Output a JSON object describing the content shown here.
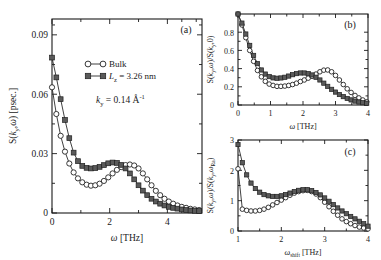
{
  "figure": {
    "background": "#ffffff",
    "line_color": "#2b2b2b",
    "square_fill": "#5a5a5a",
    "circle_fill": "#ffffff"
  },
  "legend": {
    "entries": [
      {
        "label": "Bulk",
        "marker": "open-circle"
      },
      {
        "label": "L_z = 3.26 nm",
        "marker": "filled-square",
        "prefix_italic": "L",
        "sub": "z",
        "rest": " = 3.26 nm"
      }
    ]
  },
  "annotation": {
    "k_symbol": "k",
    "k_sub": "y",
    "k_value": " = 0.14 ",
    "k_unit": "Å",
    "k_unit_sup": "-1"
  },
  "panels": {
    "a": {
      "tag": "(a)",
      "xlabel_symbol": "ω",
      "xlabel_unit": " [THz]",
      "ylabel": "S(k_y,ω)  [psec.]",
      "xticks": [
        "0",
        "2",
        "4"
      ],
      "yticks": [
        "0",
        "0.03",
        "0.06",
        "0.09"
      ]
    },
    "b": {
      "tag": "(b)",
      "xlabel_symbol": "ω",
      "xlabel_unit": " [THz]",
      "ylabel": "S(k_y,ω)/S(k_y,0)",
      "xticks": [
        "0",
        "1",
        "2",
        "3",
        "4"
      ],
      "yticks": [
        "0",
        "0.2",
        "0.4",
        "0.6",
        "0.8"
      ]
    },
    "c": {
      "tag": "(c)",
      "xlabel_symbol": "ω",
      "xlabel_sub": "shift",
      "xlabel_unit": " [THz]",
      "ylabel": "S(k_y,ω)/S(k_y,ω_Ra)",
      "xticks": [
        "1",
        "2",
        "3",
        "4"
      ],
      "yticks": [
        "0",
        "1",
        "2",
        "3"
      ]
    }
  },
  "chart_data": [
    {
      "type": "line",
      "panel": "a",
      "title": "(a)",
      "xlabel": "ω [THz]",
      "ylabel": "S(k_y,ω) [psec.]",
      "xlim": [
        0,
        5.2
      ],
      "ylim": [
        0,
        0.098
      ],
      "xticks": [
        0,
        2,
        4
      ],
      "yticks": [
        0,
        0.03,
        0.06,
        0.09
      ],
      "grid": false,
      "legend": "inside-top-center",
      "annotation": "k_y = 0.14 Å^-1",
      "series": [
        {
          "name": "Bulk",
          "marker": "open-circle",
          "x": [
            0,
            0.15,
            0.3,
            0.45,
            0.6,
            0.75,
            0.9,
            1.05,
            1.2,
            1.35,
            1.5,
            1.65,
            1.8,
            1.95,
            2.1,
            2.25,
            2.4,
            2.55,
            2.7,
            2.85,
            3.0,
            3.15,
            3.3,
            3.45,
            3.6,
            3.75,
            3.9,
            4.05,
            4.2,
            4.35,
            4.5,
            4.65,
            4.8,
            4.95,
            5.1
          ],
          "y": [
            0.0635,
            0.05,
            0.039,
            0.031,
            0.025,
            0.0205,
            0.0175,
            0.0155,
            0.0143,
            0.0138,
            0.014,
            0.0148,
            0.0162,
            0.018,
            0.02,
            0.0218,
            0.0232,
            0.0242,
            0.0245,
            0.024,
            0.0225,
            0.02,
            0.017,
            0.014,
            0.0112,
            0.009,
            0.0072,
            0.0058,
            0.0047,
            0.0038,
            0.0031,
            0.0026,
            0.0021,
            0.0018,
            0.0015
          ]
        },
        {
          "name": "L_z = 3.26 nm",
          "marker": "filled-square",
          "x": [
            0,
            0.15,
            0.3,
            0.45,
            0.6,
            0.75,
            0.9,
            1.05,
            1.2,
            1.35,
            1.5,
            1.65,
            1.8,
            1.95,
            2.1,
            2.25,
            2.4,
            2.55,
            2.7,
            2.85,
            3.0,
            3.15,
            3.3,
            3.45,
            3.6,
            3.75,
            3.9,
            4.05,
            4.2,
            4.35,
            4.5,
            4.65,
            4.8,
            4.95,
            5.1
          ],
          "y": [
            0.0785,
            0.0685,
            0.0575,
            0.047,
            0.0378,
            0.0305,
            0.0262,
            0.0238,
            0.0228,
            0.0225,
            0.0227,
            0.0233,
            0.0242,
            0.0251,
            0.0255,
            0.0253,
            0.0243,
            0.0225,
            0.02,
            0.017,
            0.014,
            0.0113,
            0.009,
            0.0072,
            0.0058,
            0.0047,
            0.0038,
            0.0031,
            0.0026,
            0.0022,
            0.0018,
            0.0015,
            0.0013,
            0.0011,
            0.001
          ]
        }
      ]
    },
    {
      "type": "line",
      "panel": "b",
      "title": "(b)",
      "xlabel": "ω [THz]",
      "ylabel": "S(k_y,ω)/S(k_y,0)",
      "xlim": [
        0,
        4
      ],
      "ylim": [
        0,
        1.0
      ],
      "xticks": [
        0,
        1,
        2,
        3,
        4
      ],
      "yticks": [
        0,
        0.2,
        0.4,
        0.6,
        0.8
      ],
      "grid": false,
      "series": [
        {
          "name": "Bulk",
          "marker": "open-circle",
          "x": [
            0,
            0.12,
            0.24,
            0.36,
            0.48,
            0.6,
            0.72,
            0.84,
            0.96,
            1.08,
            1.2,
            1.32,
            1.44,
            1.56,
            1.68,
            1.8,
            1.92,
            2.04,
            2.16,
            2.28,
            2.4,
            2.52,
            2.64,
            2.76,
            2.88,
            3.0,
            3.12,
            3.24,
            3.36,
            3.48,
            3.6,
            3.72,
            3.84,
            3.96
          ],
          "y": [
            1.0,
            0.88,
            0.74,
            0.6,
            0.48,
            0.38,
            0.31,
            0.26,
            0.23,
            0.215,
            0.205,
            0.205,
            0.208,
            0.215,
            0.225,
            0.24,
            0.258,
            0.275,
            0.295,
            0.315,
            0.34,
            0.365,
            0.383,
            0.385,
            0.365,
            0.325,
            0.275,
            0.225,
            0.178,
            0.138,
            0.105,
            0.078,
            0.055,
            0.035
          ]
        },
        {
          "name": "L_z = 3.26 nm",
          "marker": "filled-square",
          "x": [
            0,
            0.12,
            0.24,
            0.36,
            0.48,
            0.6,
            0.72,
            0.84,
            0.96,
            1.08,
            1.2,
            1.32,
            1.44,
            1.56,
            1.68,
            1.8,
            1.92,
            2.04,
            2.16,
            2.28,
            2.4,
            2.52,
            2.64,
            2.76,
            2.88,
            3.0,
            3.12,
            3.24,
            3.36,
            3.48,
            3.6,
            3.72,
            3.84,
            3.96
          ],
          "y": [
            1.0,
            0.9,
            0.78,
            0.655,
            0.545,
            0.455,
            0.385,
            0.34,
            0.312,
            0.298,
            0.294,
            0.297,
            0.305,
            0.318,
            0.333,
            0.345,
            0.352,
            0.352,
            0.345,
            0.33,
            0.305,
            0.275,
            0.24,
            0.205,
            0.172,
            0.142,
            0.115,
            0.092,
            0.072,
            0.056,
            0.043,
            0.033,
            0.025,
            0.02
          ]
        }
      ]
    },
    {
      "type": "line",
      "panel": "c",
      "title": "(c)",
      "xlabel": "ω_shift [THz]",
      "ylabel": "S(k_y,ω)/S(k_y,ω_Ra)",
      "xlim": [
        1,
        4
      ],
      "ylim": [
        0,
        3.0
      ],
      "xticks": [
        1,
        2,
        3,
        4
      ],
      "yticks": [
        0,
        1,
        2,
        3
      ],
      "grid": false,
      "series": [
        {
          "name": "Bulk",
          "marker": "open-circle",
          "x": [
            1.0,
            1.1,
            1.2,
            1.3,
            1.4,
            1.5,
            1.6,
            1.7,
            1.8,
            1.9,
            2.0,
            2.1,
            2.2,
            2.3,
            2.4,
            2.5,
            2.6,
            2.7,
            2.8,
            2.9,
            3.0,
            3.1,
            3.2,
            3.3,
            3.4,
            3.5,
            3.6,
            3.7,
            3.8,
            3.9,
            4.0
          ],
          "y": [
            2.05,
            0.72,
            0.68,
            0.66,
            0.66,
            0.68,
            0.72,
            0.78,
            0.86,
            0.94,
            1.02,
            1.1,
            1.18,
            1.25,
            1.3,
            1.33,
            1.34,
            1.3,
            1.22,
            1.1,
            0.95,
            0.8,
            0.65,
            0.52,
            0.4,
            0.31,
            0.24,
            0.18,
            0.13,
            0.1,
            0.07
          ]
        },
        {
          "name": "L_z = 3.26 nm",
          "marker": "filled-square",
          "x": [
            1.0,
            1.1,
            1.2,
            1.3,
            1.4,
            1.5,
            1.6,
            1.7,
            1.8,
            1.9,
            2.0,
            2.1,
            2.2,
            2.3,
            2.4,
            2.5,
            2.6,
            2.7,
            2.8,
            2.9,
            3.0,
            3.1,
            3.2,
            3.3,
            3.4,
            3.5,
            3.6,
            3.7,
            3.8,
            3.9,
            4.0
          ],
          "y": [
            2.85,
            2.25,
            1.85,
            1.58,
            1.4,
            1.28,
            1.2,
            1.16,
            1.14,
            1.14,
            1.16,
            1.2,
            1.25,
            1.3,
            1.34,
            1.36,
            1.36,
            1.33,
            1.27,
            1.19,
            1.09,
            0.98,
            0.87,
            0.76,
            0.66,
            0.57,
            0.48,
            0.4,
            0.32,
            0.24,
            0.16
          ]
        }
      ]
    }
  ]
}
